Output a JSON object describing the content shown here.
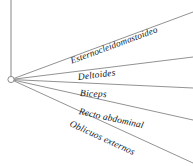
{
  "diagram": {
    "title": "",
    "type": "radial-fan-leader-lines",
    "background_color": "#ffffff",
    "line_color": "#8c8c8c",
    "text_color": "#171717",
    "origin": {
      "name": "origin-node",
      "x": 11,
      "y": 79.5,
      "radius": 3.1,
      "marker": "open-circle"
    },
    "axis": {
      "name": "vertical-axis",
      "x": 11,
      "y_top": 0,
      "y_bottom": 79.5
    },
    "rays": [
      {
        "id": "ray-esternocleidomastoideo",
        "label": "Esternocleidomastoideo",
        "x1": 11,
        "y1": 79.5,
        "x2": 193,
        "y2": 12,
        "angle_deg": -20.3,
        "label_x": 71,
        "label_y": 57,
        "muscle": "Esternocleidomastoideo"
      },
      {
        "id": "ray-deltoides",
        "label": "Deltoides",
        "x1": 11,
        "y1": 79.5,
        "x2": 193,
        "y2": 57,
        "angle_deg": -7.0,
        "label_x": 78,
        "label_y": 73,
        "muscle": "Deltoides"
      },
      {
        "id": "ray-biceps",
        "label": "Biceps",
        "x1": 11,
        "y1": 79.5,
        "x2": 193,
        "y2": 88,
        "angle_deg": 2.7,
        "label_x": 80,
        "label_y": 88,
        "muscle": "Biceps"
      },
      {
        "id": "ray-recto-abdominal",
        "label": "Recto abdominal",
        "x1": 11,
        "y1": 79.5,
        "x2": 193,
        "y2": 120,
        "angle_deg": 12.5,
        "label_x": 79,
        "label_y": 107,
        "muscle": "Recto abdominal"
      },
      {
        "id": "ray-oblicuos-externos",
        "label": "Oblicuos externos",
        "x1": 11,
        "y1": 79.5,
        "x2": 193,
        "y2": 163,
        "angle_deg": 24.6,
        "label_x": 70,
        "label_y": 119,
        "muscle": "Oblicuos externos"
      }
    ]
  }
}
